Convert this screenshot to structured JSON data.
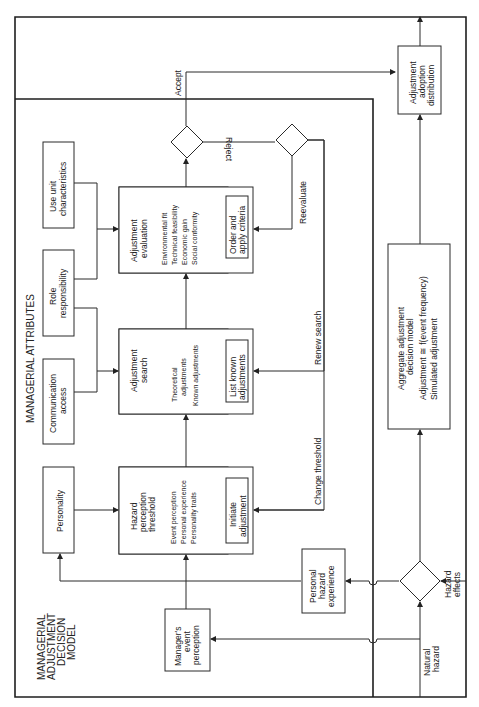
{
  "diagram": {
    "orientation": "rotated-90-ccw",
    "title": [
      "MANAGERIAL",
      "ADJUSTMENT",
      "DECISION",
      "MODEL"
    ],
    "section_label": "MANAGERIAL ATTRIBUTES",
    "attributes": {
      "personality": "Personality",
      "communication_access": [
        "Communication",
        "access"
      ],
      "role_responsibility": [
        "Role",
        "responsibility"
      ],
      "use_unit_characteristics": [
        "Use unit",
        "characteristics"
      ]
    },
    "hazard_threshold": {
      "title": [
        "Hazard",
        "perception",
        "threshold"
      ],
      "bullets": [
        "Event perception",
        "Personal experience",
        "Personality traits"
      ],
      "action": [
        "Initiate",
        "adjustment"
      ]
    },
    "adjustment_search": {
      "title": [
        "Adjustment",
        "search"
      ],
      "bullets": [
        "Theoretical",
        "adjustments",
        "Known adjustments"
      ],
      "action": [
        "List known",
        "adjustments"
      ]
    },
    "adjustment_evaluation": {
      "title": [
        "Adjustment",
        "evaluation"
      ],
      "bullets": [
        "Environmental fit",
        "Technical feasibility",
        "Economic gain",
        "Social conformity"
      ],
      "action": [
        "Order and",
        "apply criteria"
      ]
    },
    "managers_event_perception": [
      "Manager's",
      "event",
      "perception"
    ],
    "personal_hazard_experience": [
      "Personal",
      "hazard",
      "experience"
    ],
    "aggregate_model": {
      "lines": [
        "Aggregate adjustment",
        "decision model",
        "Adjustment ≅ f(event frequency)",
        "Simulated adjustment"
      ]
    },
    "adoption_distribution": [
      "Adjustment",
      "adoption",
      "distribution"
    ],
    "flow_labels": {
      "accept": "Accept",
      "reject": "Reject",
      "reevaluate": "Reevaluate",
      "renew_search": "Renew search",
      "change_threshold": "Change threshold",
      "natural_hazard": [
        "Natural",
        "hazard"
      ],
      "hazard_effects": [
        "Hazard",
        "effects"
      ]
    }
  }
}
